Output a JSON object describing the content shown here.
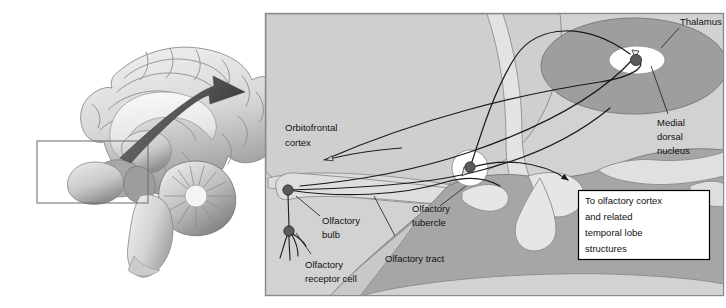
{
  "figure": {
    "panels": {
      "left": {
        "name": "midsagittal-brain-illustration",
        "inset_box_present": true
      },
      "right": {
        "name": "olfactory-pathway-detail",
        "border_color": "#8a8a8a",
        "background_color": "#d2d2d2"
      }
    }
  },
  "labels": {
    "orbitofrontal_cortex": "Orbitofrontal\ncortex",
    "orbitofrontal_cortex_line1": "Orbitofrontal",
    "orbitofrontal_cortex_line2": "cortex",
    "thalamus": "Thalamus",
    "medial_dorsal_nucleus_line1": "Medial",
    "medial_dorsal_nucleus_line2": "dorsal",
    "medial_dorsal_nucleus_line3": "nucleus",
    "olfactory_bulb_line1": "Olfactory",
    "olfactory_bulb_line2": "bulb",
    "olfactory_receptor_cell_line1": "Olfactory",
    "olfactory_receptor_cell_line2": "receptor cell",
    "olfactory_tubercle_line1": "Olfactory",
    "olfactory_tubercle_line2": "tubercle",
    "olfactory_tract": "Olfactory tract"
  },
  "callout_box": {
    "name": "to-olfactory-cortex-callout",
    "line1": "To olfactory cortex",
    "line2": "and related",
    "line3": "temporal lobe",
    "line4": "structures",
    "background_color": "#ffffff",
    "border_color": "#000000"
  },
  "colors": {
    "panel_background": "#d2d2d2",
    "panel_border": "#8a8a8a",
    "thalamus_fill": "#9e9e9e",
    "mid_gray_fill": "#b4b4b4",
    "light_fill": "#e4e4e4",
    "white_fill": "#ffffff",
    "node_fill": "#5a5a5a",
    "line_stroke": "#1a1a1a",
    "arrow_fill": "#555555",
    "brain_light": "#e8e8e8",
    "brain_mid": "#bdbdbd",
    "brain_dark": "#8d8d8d"
  },
  "nodes": [
    {
      "name": "olfactory-bulb-node",
      "cx": 288,
      "cy": 190
    },
    {
      "name": "olfactory-receptor-cell-node",
      "cx": 289,
      "cy": 231
    },
    {
      "name": "olfactory-tubercle-node",
      "cx": 470,
      "cy": 167
    },
    {
      "name": "medial-dorsal-nucleus-node",
      "cx": 636,
      "cy": 60
    }
  ]
}
